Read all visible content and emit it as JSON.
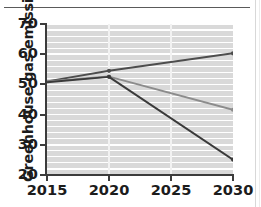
{
  "chart_data": {
    "type": "line",
    "title": "",
    "xlabel": "",
    "ylabel": "Greenhouse gas emissions (Gt)",
    "x": [
      2015,
      2020,
      2025,
      2030
    ],
    "xlim": [
      2015,
      2030
    ],
    "ylim": [
      20,
      70
    ],
    "xticks": [
      "2015",
      "2020",
      "2025",
      "2030"
    ],
    "yticks": [
      "20",
      "30",
      "40",
      "50",
      "60",
      "70"
    ],
    "grid": "horizontal-white-on-gray",
    "legend": "none",
    "series": [
      {
        "name": "current-policies",
        "color": "#4d4d4d",
        "markers": true,
        "points": [
          {
            "x": 2015,
            "y": 51.0
          },
          {
            "x": 2020,
            "y": 54.5
          },
          {
            "x": 2030,
            "y": 60.3
          }
        ]
      },
      {
        "name": "pledges",
        "color": "#8c8c8c",
        "markers": true,
        "points": [
          {
            "x": 2015,
            "y": 51.0
          },
          {
            "x": 2020,
            "y": 52.6
          },
          {
            "x": 2030,
            "y": 41.6
          }
        ]
      },
      {
        "name": "below-2c-pathway",
        "color": "#3a3a3a",
        "markers": true,
        "points": [
          {
            "x": 2015,
            "y": 50.7
          },
          {
            "x": 2020,
            "y": 52.5
          },
          {
            "x": 2030,
            "y": 25.1
          }
        ]
      }
    ]
  },
  "axis": {
    "y_title": "Greenhouse gas emissions (Gt)",
    "y_tick_labels": [
      "70",
      "60",
      "50",
      "40",
      "30",
      "20"
    ],
    "x_tick_labels": [
      "2015",
      "2020",
      "2025",
      "2030"
    ]
  },
  "colors": {
    "plot_background": "#d9d9d9",
    "gridline": "#ffffff",
    "axis": "#3c3c3c",
    "text": "#1c1c1c",
    "page_background": "#ffffff",
    "top_rule": "#5a5a5a"
  }
}
